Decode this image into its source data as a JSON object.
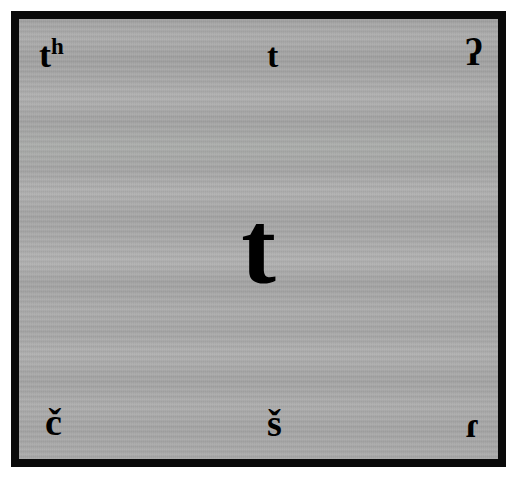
{
  "figure": {
    "center_symbol": "t",
    "background_color": "#a9a9a9",
    "border_color": "#0a0a0a",
    "symbol_color": "#000000",
    "page_color": "#ffffff"
  },
  "symbols": {
    "top_left": {
      "base": "t",
      "superscript": "h",
      "full": "tʰ",
      "name": "aspirated-voiceless-alveolar-stop"
    },
    "top_center": {
      "full": "t",
      "name": "voiceless-alveolar-stop"
    },
    "top_right": {
      "full": "ʔ",
      "name": "glottal-stop"
    },
    "center": {
      "full": "t",
      "name": "voiceless-alveolar-stop-large"
    },
    "bottom_left": {
      "full": "č",
      "name": "voiceless-postalveolar-affricate"
    },
    "bottom_center": {
      "full": "š",
      "name": "voiceless-postalveolar-fricative"
    },
    "bottom_right": {
      "full": "ɾ",
      "name": "alveolar-tap"
    }
  }
}
